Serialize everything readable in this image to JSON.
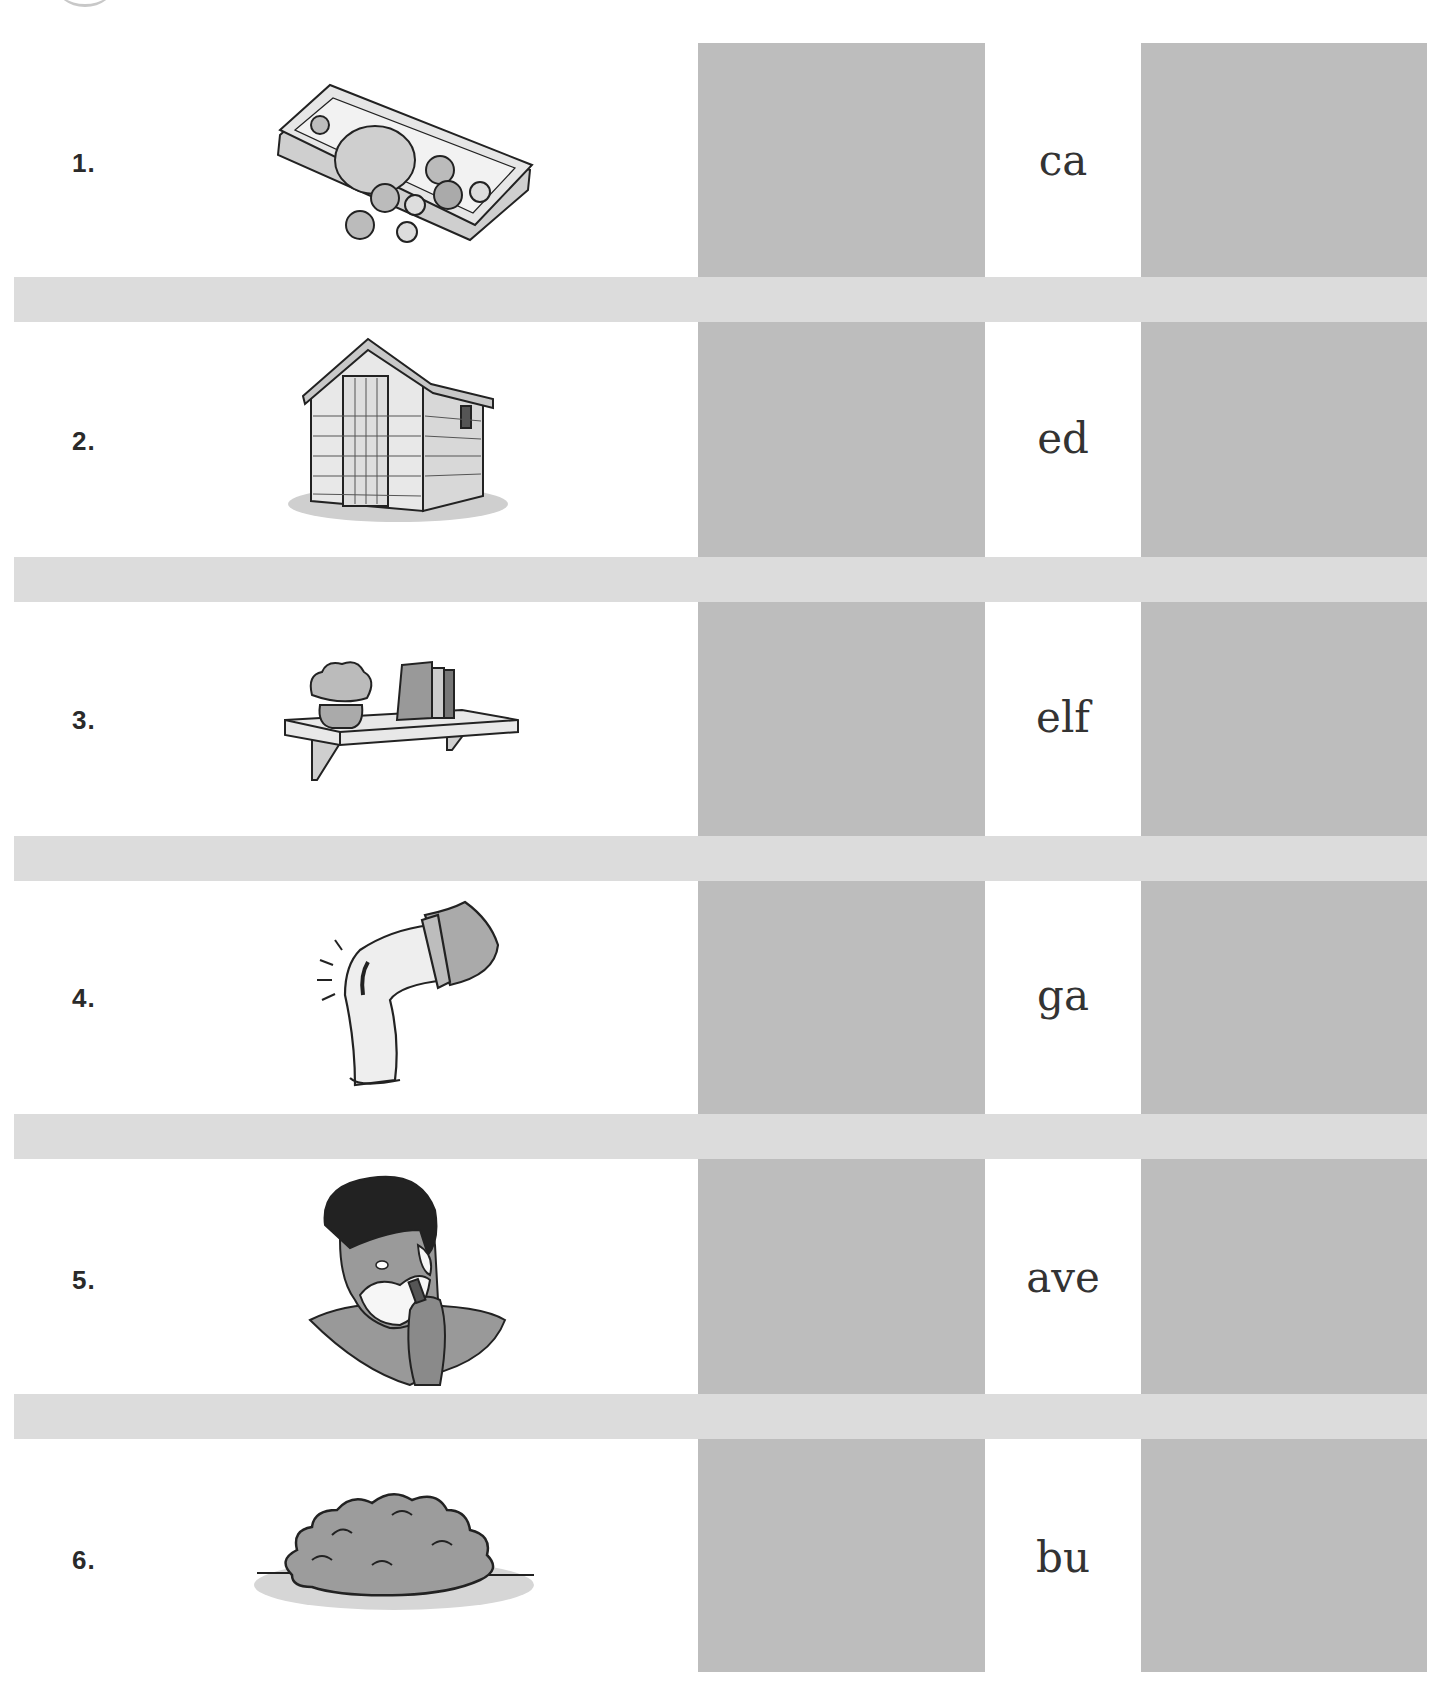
{
  "worksheet": {
    "colors": {
      "answer_box": "#bdbdbd",
      "separator_band": "#dcdcdc",
      "text": "#333333"
    },
    "rows": [
      {
        "number": "1.",
        "picture": "money-icon",
        "word_part": "ca"
      },
      {
        "number": "2.",
        "picture": "shed-icon",
        "word_part": "ed"
      },
      {
        "number": "3.",
        "picture": "shelf-icon",
        "word_part": "elf"
      },
      {
        "number": "4.",
        "picture": "grazed-elbow-icon",
        "word_part": "ga"
      },
      {
        "number": "5.",
        "picture": "shaving-man-icon",
        "word_part": "ave"
      },
      {
        "number": "6.",
        "picture": "bush-icon",
        "word_part": "bu"
      }
    ]
  }
}
